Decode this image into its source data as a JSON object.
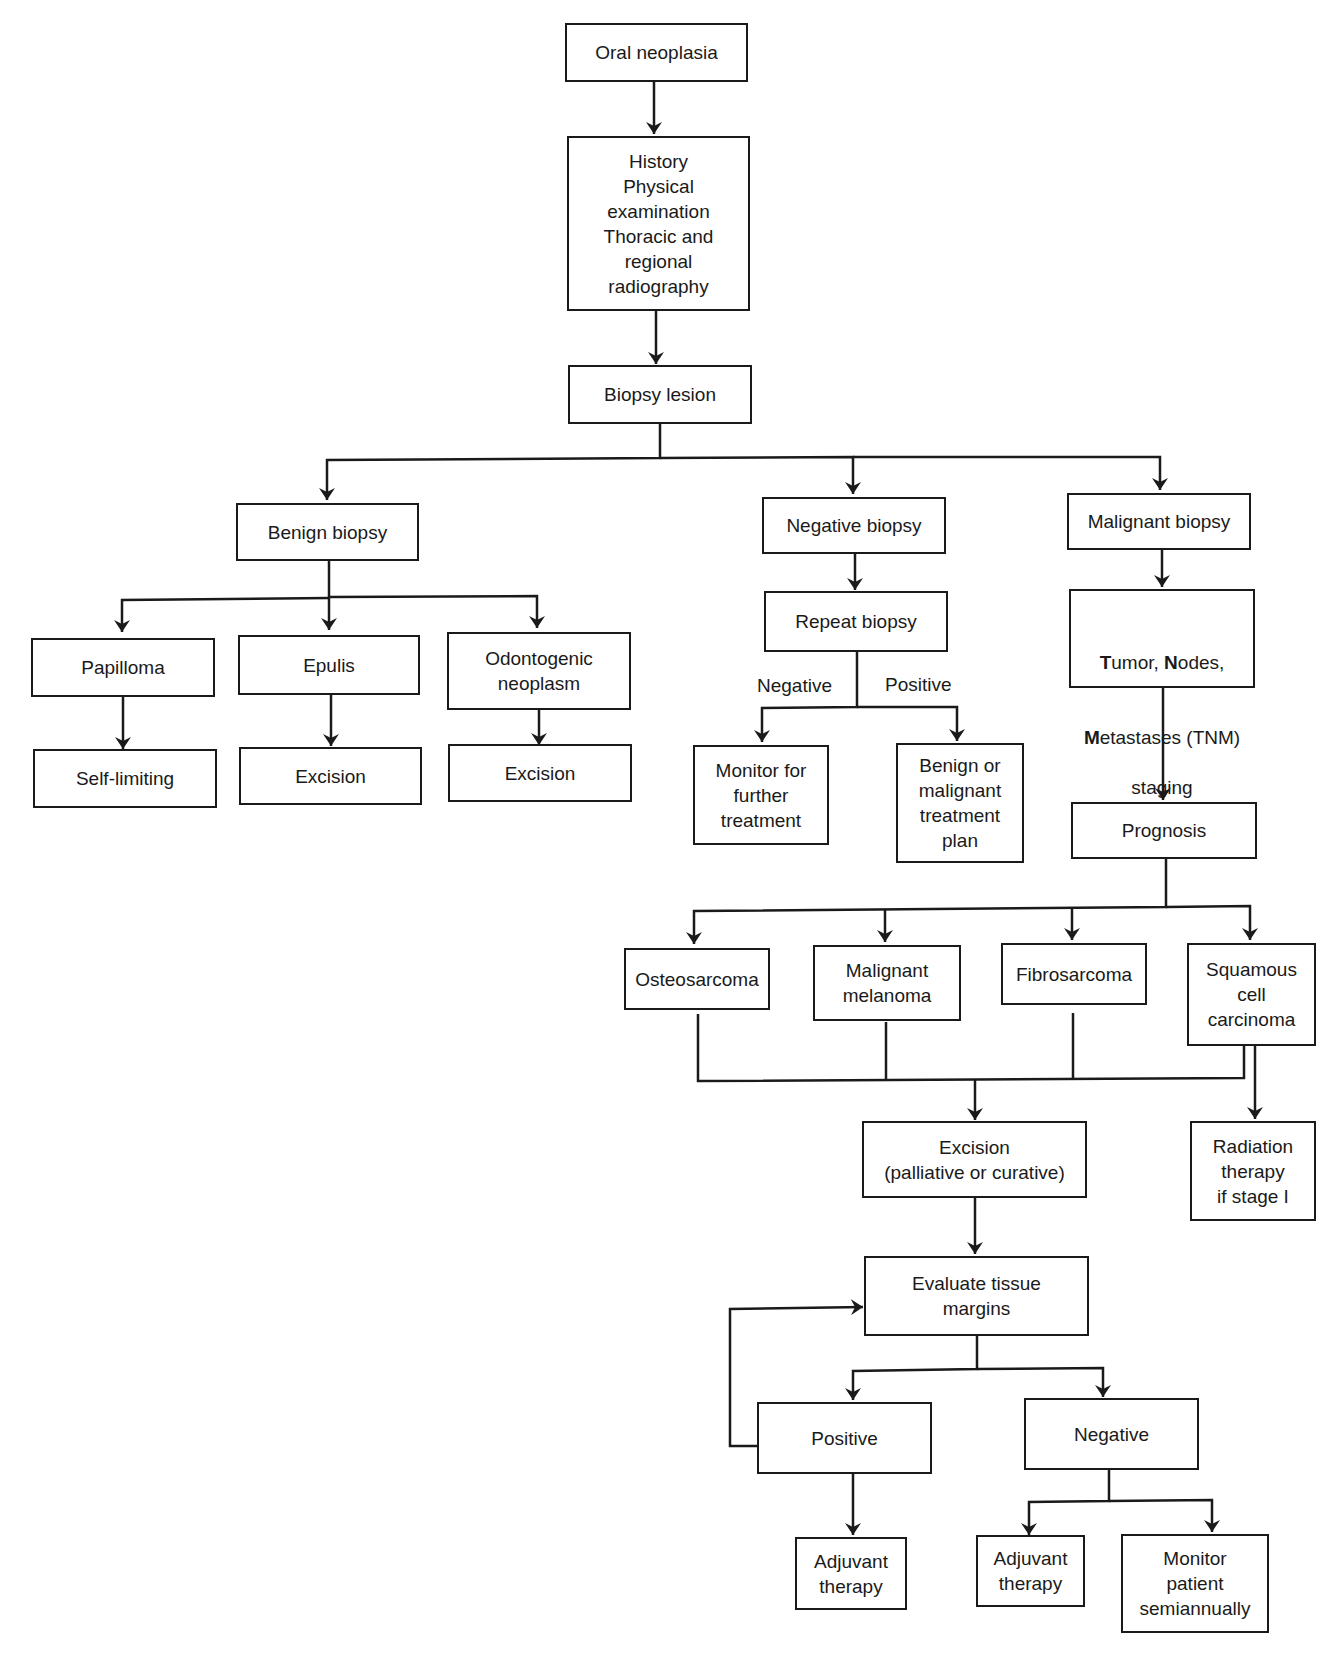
{
  "diagram": {
    "type": "flowchart",
    "nodes": {
      "oral_neoplasia": "Oral neoplasia",
      "workup": "History\nPhysical\nexamination\nThoracic and\nregional\nradiography",
      "biopsy_lesion": "Biopsy lesion",
      "benign_biopsy": "Benign biopsy",
      "negative_biopsy": "Negative biopsy",
      "malignant_biopsy": "Malignant biopsy",
      "papilloma": "Papilloma",
      "epulis": "Epulis",
      "odontogenic_neoplasm": "Odontogenic\nneoplasm",
      "self_limiting": "Self-limiting",
      "excision_epulis": "Excision",
      "excision_odontogenic": "Excision",
      "repeat_biopsy": "Repeat biopsy",
      "monitor_further": "Monitor for\nfurther\ntreatment",
      "benign_or_malignant_plan": "Benign or\nmalignant\ntreatment\nplan",
      "tnm_staging": {
        "parts": [
          {
            "initial": "T",
            "rest": "umor, "
          },
          {
            "initial": "N",
            "rest": "odes,"
          },
          {
            "initial": "M",
            "rest": "etastases (TNM)"
          }
        ],
        "last_line": "staging"
      },
      "prognosis": "Prognosis",
      "osteosarcoma": "Osteosarcoma",
      "malignant_melanoma": "Malignant\nmelanoma",
      "fibrosarcoma": "Fibrosarcoma",
      "squamous_cell_carcinoma": "Squamous\ncell\ncarcinoma",
      "excision_main": "Excision\n(palliative or curative)",
      "radiation_therapy": "Radiation\ntherapy\nif stage I",
      "evaluate_margins": "Evaluate tissue\nmargins",
      "margins_positive": "Positive",
      "margins_negative": "Negative",
      "adjuvant_positive": "Adjuvant\ntherapy",
      "adjuvant_negative": "Adjuvant\ntherapy",
      "monitor_semiannually": "Monitor\npatient\nsemiannually"
    },
    "edge_labels": {
      "repeat_negative": "Negative",
      "repeat_positive": "Positive"
    },
    "edges": [
      [
        "oral_neoplasia",
        "workup"
      ],
      [
        "workup",
        "biopsy_lesion"
      ],
      [
        "biopsy_lesion",
        "benign_biopsy"
      ],
      [
        "biopsy_lesion",
        "negative_biopsy"
      ],
      [
        "biopsy_lesion",
        "malignant_biopsy"
      ],
      [
        "benign_biopsy",
        "papilloma"
      ],
      [
        "benign_biopsy",
        "epulis"
      ],
      [
        "benign_biopsy",
        "odontogenic_neoplasm"
      ],
      [
        "papilloma",
        "self_limiting"
      ],
      [
        "epulis",
        "excision_epulis"
      ],
      [
        "odontogenic_neoplasm",
        "excision_odontogenic"
      ],
      [
        "negative_biopsy",
        "repeat_biopsy"
      ],
      [
        "repeat_biopsy",
        "monitor_further",
        "Negative"
      ],
      [
        "repeat_biopsy",
        "benign_or_malignant_plan",
        "Positive"
      ],
      [
        "malignant_biopsy",
        "tnm_staging"
      ],
      [
        "tnm_staging",
        "prognosis"
      ],
      [
        "prognosis",
        "osteosarcoma"
      ],
      [
        "prognosis",
        "malignant_melanoma"
      ],
      [
        "prognosis",
        "fibrosarcoma"
      ],
      [
        "prognosis",
        "squamous_cell_carcinoma"
      ],
      [
        "osteosarcoma",
        "excision_main"
      ],
      [
        "malignant_melanoma",
        "excision_main"
      ],
      [
        "fibrosarcoma",
        "excision_main"
      ],
      [
        "squamous_cell_carcinoma",
        "excision_main"
      ],
      [
        "squamous_cell_carcinoma",
        "radiation_therapy"
      ],
      [
        "excision_main",
        "evaluate_margins"
      ],
      [
        "evaluate_margins",
        "margins_positive"
      ],
      [
        "evaluate_margins",
        "margins_negative"
      ],
      [
        "margins_positive",
        "evaluate_margins"
      ],
      [
        "margins_positive",
        "adjuvant_positive"
      ],
      [
        "margins_negative",
        "adjuvant_negative"
      ],
      [
        "margins_negative",
        "monitor_semiannually"
      ]
    ]
  },
  "colors": {
    "line": "#1a1a1a",
    "background": "#ffffff"
  }
}
